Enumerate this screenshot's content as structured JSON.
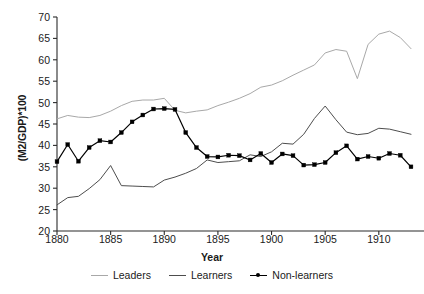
{
  "chart_data": {
    "type": "line",
    "title": "",
    "xlabel": "Year",
    "ylabel": "(M2/GDP)*100",
    "xlim": [
      1880,
      1913
    ],
    "ylim": [
      20,
      70
    ],
    "xticks": [
      1880,
      1885,
      1890,
      1895,
      1900,
      1905,
      1910
    ],
    "yticks": [
      20,
      25,
      30,
      35,
      40,
      45,
      50,
      55,
      60,
      65,
      70
    ],
    "grid": false,
    "legend_position": "bottom-center",
    "x": [
      1880,
      1881,
      1882,
      1883,
      1884,
      1885,
      1886,
      1887,
      1888,
      1889,
      1890,
      1891,
      1892,
      1893,
      1894,
      1895,
      1896,
      1897,
      1898,
      1899,
      1900,
      1901,
      1902,
      1903,
      1904,
      1905,
      1906,
      1907,
      1908,
      1909,
      1910,
      1911,
      1912,
      1913
    ],
    "series": [
      {
        "name": "Leaders",
        "color": "#a8a8a8",
        "marker": "none",
        "values": [
          46.2,
          47.0,
          46.6,
          46.5,
          47.0,
          48.0,
          49.3,
          50.3,
          50.6,
          50.6,
          51.0,
          48.2,
          47.6,
          48.0,
          48.3,
          49.3,
          50.1,
          51.0,
          52.1,
          53.6,
          54.1,
          55.1,
          56.4,
          57.6,
          58.8,
          61.6,
          62.4,
          62.0,
          55.6,
          63.6,
          66.0,
          66.7,
          65.2,
          62.6
        ]
      },
      {
        "name": "Learners",
        "color": "#4d4d4d",
        "marker": "none",
        "values": [
          26.1,
          27.8,
          28.1,
          29.9,
          32.0,
          35.3,
          30.6,
          30.5,
          30.4,
          30.3,
          31.9,
          32.6,
          33.5,
          34.6,
          36.6,
          36.0,
          36.2,
          36.4,
          37.8,
          37.4,
          38.5,
          40.5,
          40.3,
          42.6,
          46.3,
          49.2,
          46.0,
          43.1,
          42.5,
          42.8,
          44.0,
          43.8,
          43.2,
          42.6
        ]
      },
      {
        "name": "Non-learners",
        "color": "#000000",
        "marker": "square",
        "values": [
          36.2,
          40.2,
          36.3,
          39.5,
          41.1,
          40.8,
          43.0,
          45.5,
          47.1,
          48.5,
          48.6,
          48.4,
          43.0,
          39.5,
          37.4,
          37.3,
          37.7,
          37.6,
          36.6,
          38.1,
          36.0,
          38.0,
          37.6,
          35.4,
          35.5,
          36.0,
          38.3,
          39.9,
          36.8,
          37.4,
          37.0,
          38.1,
          37.7,
          35.0
        ]
      }
    ]
  }
}
